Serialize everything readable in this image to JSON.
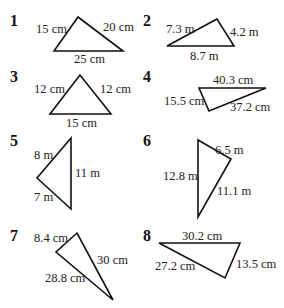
{
  "figures": [
    {
      "number": "1",
      "sides": [
        "15 cm",
        "20 cm",
        "25 cm"
      ]
    },
    {
      "number": "2",
      "sides": [
        "7.3 m",
        "4.2 m",
        "8.7 m"
      ]
    },
    {
      "number": "3",
      "sides": [
        "12 cm",
        "12 cm",
        "15 cm"
      ]
    },
    {
      "number": "4",
      "sides": [
        "40.3 cm",
        "15.5 cm",
        "37.2 cm"
      ]
    },
    {
      "number": "5",
      "sides": [
        "8 m",
        "11 m",
        "7 m"
      ]
    },
    {
      "number": "6",
      "sides": [
        "6.5 m",
        "12.8 m",
        "11.1 m"
      ]
    },
    {
      "number": "7",
      "sides": [
        "8.4 cm",
        "30 cm",
        "28.8 cm"
      ]
    },
    {
      "number": "8",
      "sides": [
        "30.2 cm",
        "27.2 cm",
        "13.5 cm"
      ]
    }
  ]
}
